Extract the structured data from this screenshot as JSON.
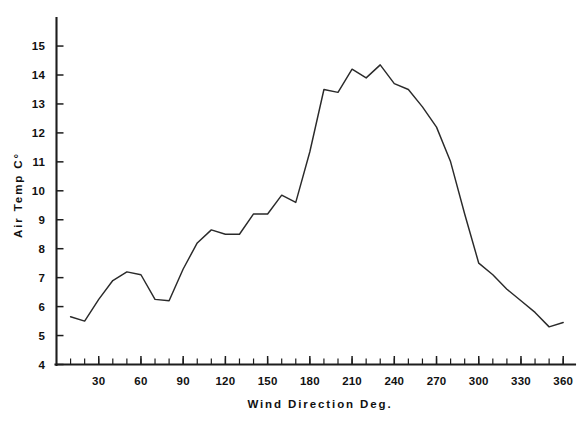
{
  "chart_data": {
    "type": "line",
    "title": "",
    "xlabel": "Wind Direction Deg.",
    "ylabel": "Air Temp C°",
    "xlim": [
      0,
      368
    ],
    "ylim": [
      4,
      15.8
    ],
    "grid": false,
    "legend": null,
    "x_ticks_major": [
      30,
      60,
      90,
      120,
      150,
      180,
      210,
      240,
      270,
      300,
      330,
      360
    ],
    "x_tick_labels": [
      "30",
      "60",
      "90",
      "120",
      "150",
      "180",
      "210",
      "240",
      "270",
      "300",
      "330",
      "360"
    ],
    "x_tick_minor_step": 10,
    "y_ticks_major": [
      4,
      5,
      6,
      7,
      8,
      9,
      10,
      11,
      12,
      13,
      14,
      15
    ],
    "y_tick_labels": [
      "4",
      "5",
      "6",
      "7",
      "8",
      "9",
      "10",
      "11",
      "12",
      "13",
      "14",
      "15"
    ],
    "series": [
      {
        "name": "Air Temperature",
        "color": "#2a2a2a",
        "x": [
          10,
          20,
          30,
          40,
          50,
          60,
          70,
          80,
          90,
          100,
          110,
          120,
          130,
          140,
          150,
          160,
          170,
          180,
          190,
          200,
          210,
          220,
          230,
          240,
          250,
          260,
          270,
          280,
          290,
          300,
          310,
          320,
          330,
          340,
          350,
          360
        ],
        "y": [
          5.65,
          5.5,
          6.25,
          6.9,
          7.2,
          7.1,
          6.25,
          6.2,
          7.3,
          8.2,
          8.65,
          8.5,
          8.5,
          9.2,
          9.2,
          9.85,
          9.6,
          11.35,
          13.5,
          13.4,
          14.2,
          13.9,
          14.35,
          13.7,
          13.5,
          12.9,
          12.2,
          11.0,
          9.2,
          7.5,
          7.1,
          6.6,
          6.2,
          5.8,
          5.3,
          5.45
        ]
      }
    ]
  },
  "axes": {
    "y_label_text": "Air Temp C°",
    "x_label_text": "Wind Direction Deg."
  }
}
